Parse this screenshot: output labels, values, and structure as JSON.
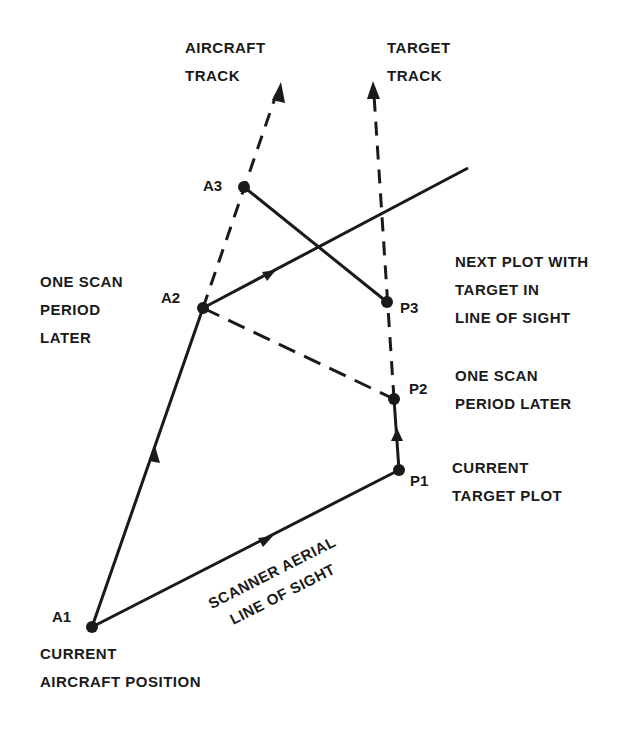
{
  "diagram": {
    "colors": {
      "ink": "#1a1a1a",
      "background": "#ffffff"
    },
    "points": {
      "A1": "A1",
      "A2": "A2",
      "A3": "A3",
      "P1": "P1",
      "P2": "P2",
      "P3": "P3"
    },
    "labels": {
      "aircraft_track": [
        "AIRCRAFT",
        "TRACK"
      ],
      "target_track": [
        "TARGET",
        "TRACK"
      ],
      "one_scan_left": [
        "ONE SCAN",
        "PERIOD",
        "LATER"
      ],
      "next_plot": [
        "NEXT PLOT WITH",
        "TARGET IN",
        "LINE OF SIGHT"
      ],
      "one_scan_right": [
        "ONE SCAN",
        "PERIOD LATER"
      ],
      "current_target": [
        "CURRENT",
        "TARGET PLOT"
      ],
      "scanner": [
        "SCANNER AERIAL",
        "LINE OF SIGHT"
      ],
      "current_aircraft": [
        "CURRENT",
        "AIRCRAFT POSITION"
      ]
    }
  }
}
